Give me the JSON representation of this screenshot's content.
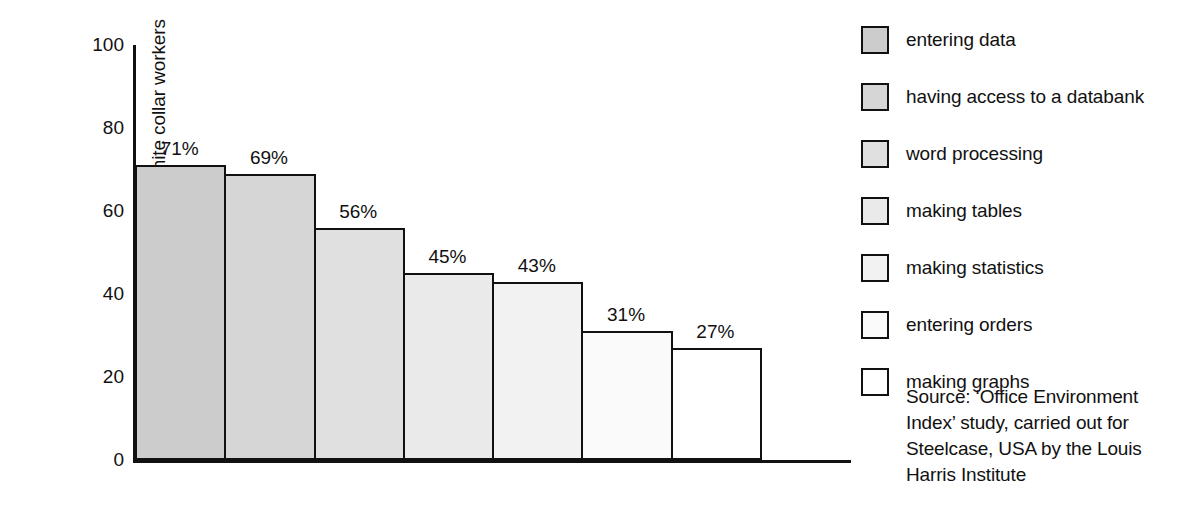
{
  "chart_data": {
    "type": "bar",
    "title": "",
    "xlabel": "",
    "ylabel": "Number of white collar workers",
    "ylim": [
      0,
      100
    ],
    "yticks": [
      "0",
      "20",
      "40",
      "60",
      "80",
      "100"
    ],
    "grid": false,
    "legend_position": "right",
    "categories": [
      "entering data",
      "having access to a databank",
      "word processing",
      "making tables",
      "making statistics",
      "entering orders",
      "making graphs"
    ],
    "values": [
      71,
      69,
      56,
      45,
      43,
      31,
      27
    ],
    "data_labels": [
      "71%",
      "69%",
      "56%",
      "45%",
      "43%",
      "31%",
      "27%"
    ],
    "bar_colors": [
      "#cccccc",
      "#d6d6d6",
      "#e0e0e0",
      "#eaeaea",
      "#f2f2f2",
      "#fafafa",
      "#ffffff"
    ],
    "bar_edge_color": "#111111",
    "axis_color": "#111111"
  },
  "legend": {
    "items": [
      {
        "label": "entering data",
        "color": "#cccccc"
      },
      {
        "label": "having access to a databank",
        "color": "#d6d6d6"
      },
      {
        "label": "word processing",
        "color": "#e0e0e0"
      },
      {
        "label": "making tables",
        "color": "#eaeaea"
      },
      {
        "label": "making statistics",
        "color": "#f2f2f2"
      },
      {
        "label": "entering orders",
        "color": "#fafafa"
      },
      {
        "label": "making graphs",
        "color": "#ffffff"
      }
    ]
  },
  "source": {
    "lines": [
      "Source: ‘Office Environment",
      "Index’ study, carried out for",
      "Steelcase, USA by the Louis",
      "Harris Institute"
    ]
  }
}
